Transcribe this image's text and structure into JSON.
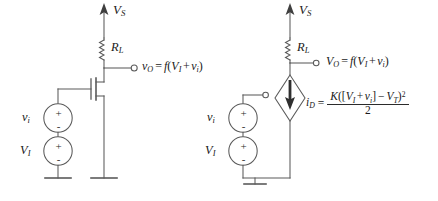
{
  "figure": {
    "background_color": "#ffffff",
    "line_color": "#4a4a4a",
    "text_color": "#1a1a1a",
    "style": "grayscale line art, serif italic math labels"
  },
  "circuits": [
    {
      "id": "left",
      "name": "mosfet-amplifier-circuit",
      "supply": {
        "label_v": "V",
        "label_sub": "S",
        "arrow": "up"
      },
      "resistor": {
        "label_v": "R",
        "label_sub": "L",
        "symbol": "coil-zigzag"
      },
      "device": {
        "type": "n-channel-mosfet",
        "terminals": [
          "gate",
          "drain",
          "source"
        ]
      },
      "output_terminal": {
        "type": "open-circle"
      },
      "output_label": {
        "lhs_main": "v",
        "lhs_sub": "O",
        "eq": "=",
        "fn": "f",
        "arg": "(V_I + v_i)",
        "plain": "v_O = f(V_I + v_i)"
      },
      "sources": [
        {
          "name": "small-signal-source",
          "label_main": "v",
          "label_sub": "i",
          "plus": "+",
          "minus": "-",
          "shape": "circle"
        },
        {
          "name": "bias-source",
          "label_main": "V",
          "label_sub": "I",
          "plus": "+",
          "minus": "-",
          "shape": "circle"
        }
      ],
      "grounds": [
        {
          "name": "source-stack-ground",
          "style": "single-bar"
        },
        {
          "name": "transistor-source-ground",
          "style": "single-bar"
        }
      ]
    },
    {
      "id": "right",
      "name": "equivalent-circuit",
      "supply": {
        "label_v": "V",
        "label_sub": "S",
        "arrow": "up"
      },
      "resistor": {
        "label_v": "R",
        "label_sub": "L",
        "symbol": "coil-zigzag"
      },
      "device": {
        "type": "dependent-current-source",
        "shape": "diamond",
        "arrow": "down"
      },
      "output_terminal": {
        "type": "open-circle"
      },
      "output_label": {
        "lhs_main": "V",
        "lhs_sub": "O",
        "eq": "=",
        "fn": "f",
        "arg": "(V_I + v_i)",
        "plain": "V_O = f(V_I + v_i)"
      },
      "current_label": {
        "main": "i",
        "sub": "D",
        "eq": "="
      },
      "current_equation": {
        "numerator_plain": "K([V_I + v_i] - V_T)^2",
        "denominator": "2",
        "K": "K",
        "V_I_main": "V",
        "V_I_sub": "I",
        "v_i_main": "v",
        "v_i_sub": "i",
        "V_T_main": "V",
        "V_T_sub": "T",
        "exponent": "2",
        "plain": "i_D = K([V_I + v_i] - V_T)^2 / 2"
      },
      "gate_terminal": {
        "type": "open-circle"
      },
      "sources": [
        {
          "name": "small-signal-source",
          "label_main": "v",
          "label_sub": "i",
          "plus": "+",
          "minus": "-",
          "shape": "circle"
        },
        {
          "name": "bias-source",
          "label_main": "V",
          "label_sub": "I",
          "plus": "+",
          "minus": "-",
          "shape": "circle"
        }
      ],
      "grounds": [
        {
          "name": "common-ground",
          "style": "single-bar"
        }
      ]
    }
  ]
}
